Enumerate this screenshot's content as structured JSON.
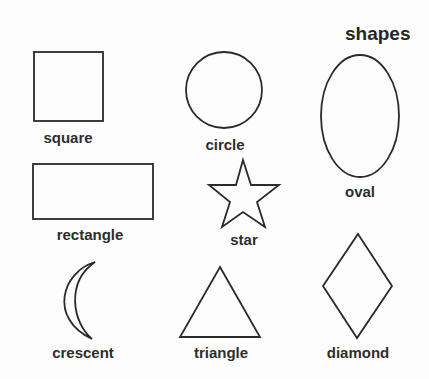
{
  "title": "shapes",
  "shapes": [
    {
      "id": "square",
      "label": "square"
    },
    {
      "id": "circle",
      "label": "circle"
    },
    {
      "id": "oval",
      "label": "oval"
    },
    {
      "id": "rectangle",
      "label": "rectangle"
    },
    {
      "id": "star",
      "label": "star"
    },
    {
      "id": "crescent",
      "label": "crescent"
    },
    {
      "id": "triangle",
      "label": "triangle"
    },
    {
      "id": "diamond",
      "label": "diamond"
    }
  ],
  "colors": {
    "stroke": "#2a2a2a",
    "text": "#2e2e2e",
    "background": "#fdfdfd"
  }
}
